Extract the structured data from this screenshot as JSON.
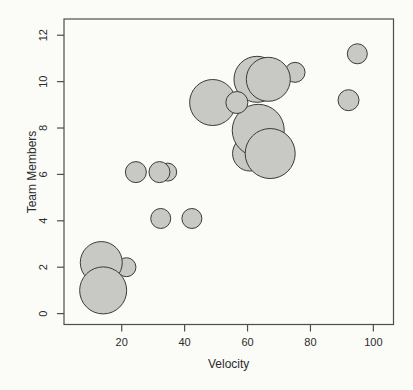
{
  "figure": {
    "background": "#fbfbf8"
  },
  "chart_data": {
    "type": "scatter",
    "subtype": "bubble",
    "title": "",
    "xlabel": "Velocity",
    "ylabel": "Team Members",
    "x_ticks": [
      20,
      40,
      60,
      80,
      100
    ],
    "y_ticks": [
      0,
      2,
      4,
      6,
      8,
      10,
      12
    ],
    "xlim": [
      1.65,
      106.4
    ],
    "ylim": [
      -0.47,
      12.7
    ],
    "grid": false,
    "legend": null,
    "bubble_fill": "#c8c8c5",
    "bubble_stroke": "#3a3a3a",
    "axis_color": "#4d4d4d",
    "text_color": "#2b2b2b",
    "points": [
      {
        "x": 34.6,
        "y": 6.1,
        "r_px": 9
      },
      {
        "x": 32.0,
        "y": 6.1,
        "r_px": 10.5
      },
      {
        "x": 24.5,
        "y": 6.1,
        "r_px": 10.5
      },
      {
        "x": 32.4,
        "y": 4.1,
        "r_px": 10
      },
      {
        "x": 42.3,
        "y": 4.1,
        "r_px": 10
      },
      {
        "x": 21.5,
        "y": 2.0,
        "r_px": 9.5
      },
      {
        "x": 13.5,
        "y": 2.2,
        "r_px": 21
      },
      {
        "x": 14.1,
        "y": 1.0,
        "r_px": 23.5
      },
      {
        "x": 48.9,
        "y": 9.1,
        "r_px": 23
      },
      {
        "x": 63.0,
        "y": 10.1,
        "r_px": 23
      },
      {
        "x": 75.1,
        "y": 10.4,
        "r_px": 10
      },
      {
        "x": 66.6,
        "y": 10.1,
        "r_px": 22
      },
      {
        "x": 60.8,
        "y": 6.9,
        "r_px": 17.5
      },
      {
        "x": 63.4,
        "y": 7.9,
        "r_px": 26
      },
      {
        "x": 67.2,
        "y": 6.9,
        "r_px": 25
      },
      {
        "x": 56.6,
        "y": 9.1,
        "r_px": 11
      },
      {
        "x": 92.1,
        "y": 9.2,
        "r_px": 10.5
      },
      {
        "x": 94.9,
        "y": 11.2,
        "r_px": 10
      }
    ]
  }
}
